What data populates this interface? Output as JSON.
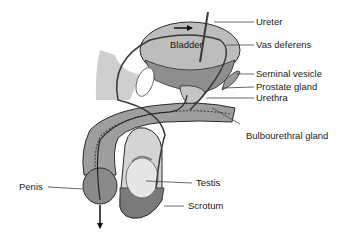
{
  "diagram": {
    "type": "anatomical-illustration",
    "organ_labels": {
      "bladder": "Bladder",
      "ureter": "Ureter",
      "vas_deferens": "Vas deferens",
      "seminal_vesicle": "Seminal vesicle",
      "prostate_gland": "Prostate gland",
      "urethra": "Urethra",
      "bulbourethral_gland": "Bulbourethral gland",
      "penis": "Penis",
      "testis": "Testis",
      "scrotum": "Scrotum"
    },
    "colors": {
      "background": "#ffffff",
      "tissue_light": "#d9d9d9",
      "tissue_mid": "#a8a8a8",
      "tissue_dark": "#6b6b6b",
      "outline": "#2a2a2a",
      "label_text": "#1a1a1a"
    }
  }
}
